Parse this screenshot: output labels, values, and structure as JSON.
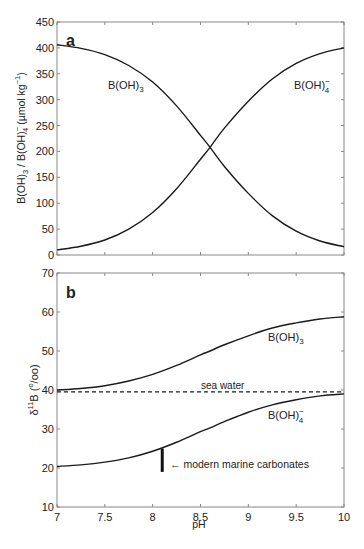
{
  "chart_data": [
    {
      "panel": "a",
      "type": "line",
      "title": "",
      "panel_label": "a",
      "xlabel": "",
      "ylabel": "B(OH)3 / B(OH)4- (µmol kg-1)",
      "xlim": [
        7,
        10
      ],
      "ylim": [
        0,
        450
      ],
      "xticks": [
        7,
        7.5,
        8,
        8.5,
        9,
        9.5,
        10
      ],
      "yticks": [
        0,
        50,
        100,
        150,
        200,
        250,
        300,
        350,
        400,
        450
      ],
      "grid": false,
      "legend": "inline labels",
      "x": [
        7.0,
        7.25,
        7.5,
        7.75,
        8.0,
        8.25,
        8.5,
        8.6,
        8.75,
        9.0,
        9.25,
        9.5,
        9.75,
        10.0
      ],
      "series": [
        {
          "name": "B(OH)3",
          "label_position": [
            7.7,
            320
          ],
          "values": [
            406,
            399,
            387,
            366,
            334,
            288,
            231,
            208,
            171,
            119,
            76,
            46,
            27,
            16
          ]
        },
        {
          "name": "B(OH)4-",
          "label_position": [
            9.75,
            372
          ],
          "values": [
            10,
            17,
            29,
            50,
            82,
            128,
            185,
            208,
            245,
            297,
            340,
            370,
            389,
            400
          ]
        }
      ]
    },
    {
      "panel": "b",
      "type": "line",
      "title": "",
      "panel_label": "b",
      "xlabel": "pH",
      "ylabel": "δ11B (‰)",
      "xlim": [
        7,
        10
      ],
      "ylim": [
        10,
        70
      ],
      "xticks": [
        7,
        7.5,
        8,
        8.5,
        9,
        9.5,
        10
      ],
      "yticks": [
        10,
        20,
        30,
        40,
        50,
        60,
        70
      ],
      "grid": false,
      "legend": "inline labels",
      "x": [
        7.0,
        7.25,
        7.5,
        7.75,
        8.0,
        8.25,
        8.5,
        8.6,
        8.75,
        9.0,
        9.25,
        9.5,
        9.75,
        10.0
      ],
      "series": [
        {
          "name": "B(OH)3",
          "label_position": [
            9.25,
            53
          ],
          "values": [
            40.0,
            40.4,
            41.1,
            42.3,
            44.0,
            46.3,
            49.0,
            50.0,
            51.6,
            53.9,
            55.9,
            57.2,
            58.2,
            58.8
          ]
        },
        {
          "name": "B(OH)4-",
          "label_position": [
            9.25,
            33
          ],
          "values": [
            20.4,
            20.8,
            21.5,
            22.6,
            24.3,
            26.6,
            29.3,
            30.3,
            31.9,
            34.3,
            36.2,
            37.5,
            38.5,
            39.0
          ]
        },
        {
          "name": "sea water",
          "style": "dashed",
          "values": [
            39.5,
            39.5,
            39.5,
            39.5,
            39.5,
            39.5,
            39.5,
            39.5,
            39.5,
            39.5,
            39.5,
            39.5,
            39.5,
            39.5
          ]
        }
      ],
      "annotations": [
        {
          "text": "sea water",
          "x": 8.0,
          "y": 40.5
        },
        {
          "text": "← modern marine carbonates",
          "x": 8.2,
          "y": 20.5
        },
        {
          "type": "vertical-bar",
          "x": 8.1,
          "y_range": [
            19,
            25
          ]
        }
      ]
    }
  ],
  "panels": {
    "a": {
      "label": "a",
      "ylabel_parts": {
        "main1": "B(OH)",
        "sub1": "3",
        "sep": " / B(OH)",
        "sup2": "−",
        "sub2": "4",
        "unit": " (µmol kg",
        "unit_sup": "−1",
        "close": ")"
      },
      "series_labels": {
        "boh3": {
          "main": "B(OH)",
          "sub": "3"
        },
        "boh4": {
          "main": "B(OH)",
          "sub": "4",
          "sup": "−"
        }
      }
    },
    "b": {
      "label": "b",
      "ylabel_parts": {
        "delta": "δ",
        "sup": "11",
        "main": "B (",
        "permil_sup": "o",
        "permil_rest": "/oo)"
      },
      "xlabel": "pH",
      "series_labels": {
        "boh3": {
          "main": "B(OH)",
          "sub": "3"
        },
        "boh4": {
          "main": "B(OH)",
          "sub": "4",
          "sup": "−"
        }
      },
      "sea_water_label": "sea water",
      "carbonates_label": "← modern marine carbonates"
    }
  },
  "colors": {
    "axis": "#888888",
    "line": "#1a1a1a",
    "text": "#222222"
  }
}
